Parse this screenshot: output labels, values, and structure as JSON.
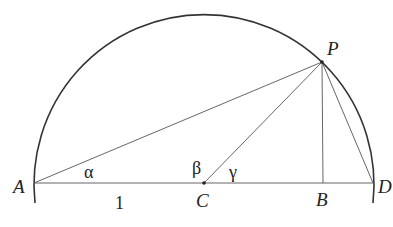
{
  "diagram": {
    "type": "semicircle-geometry",
    "points": {
      "A": {
        "label": "A",
        "x": 34,
        "y": 183
      },
      "C": {
        "label": "C",
        "x": 204,
        "y": 183
      },
      "B": {
        "label": "B",
        "x": 323,
        "y": 183
      },
      "D": {
        "label": "D",
        "x": 373,
        "y": 183
      },
      "P": {
        "label": "P",
        "x": 322,
        "y": 62
      }
    },
    "angles": {
      "alpha": "α",
      "beta": "β",
      "gamma": "γ"
    },
    "segment_labels": {
      "AC": "1"
    },
    "segments": [
      "AD",
      "AP",
      "CP",
      "PB",
      "PD"
    ],
    "arc": {
      "center": "C",
      "radius": 170
    },
    "colors": {
      "stroke": "#333333",
      "text": "#222222"
    }
  }
}
